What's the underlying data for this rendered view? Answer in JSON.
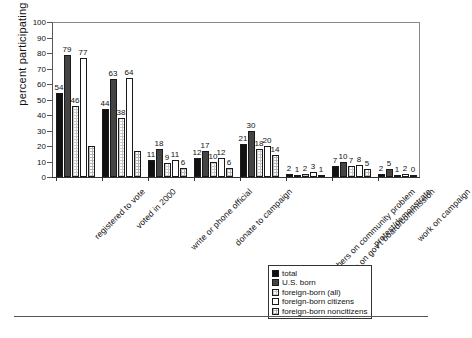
{
  "chart_data": {
    "type": "bar",
    "title": "",
    "xlabel": "",
    "ylabel": "percent participating",
    "ylim": [
      0,
      100
    ],
    "yticks": [
      0,
      10,
      20,
      30,
      40,
      50,
      60,
      70,
      80,
      90,
      100
    ],
    "grid": false,
    "legend_position": "bottom-right",
    "categories": [
      "registered to vote",
      "voted in 2000",
      "write or phone official",
      "donate to campaign",
      "work with others on community problem",
      "serve on gov't board/commission",
      "protest/demonstrate",
      "work on campaign"
    ],
    "series": [
      {
        "name": "total",
        "values": [
          54,
          44,
          11,
          12,
          21,
          2,
          7,
          2
        ]
      },
      {
        "name": "U.S. born",
        "values": [
          79,
          63,
          18,
          17,
          30,
          1,
          10,
          5
        ]
      },
      {
        "name": "foreign-born (all)",
        "values": [
          46,
          38,
          9,
          10,
          18,
          2,
          7,
          1
        ]
      },
      {
        "name": "foreign-born citizens",
        "values": [
          77,
          64,
          11,
          12,
          20,
          3,
          8,
          2
        ]
      },
      {
        "name": "foreign-born noncitizens",
        "values": [
          20,
          17,
          6,
          6,
          14,
          1,
          5,
          0
        ]
      }
    ],
    "value_labels": {
      "registered to vote": [
        "54",
        "79",
        "46",
        "77",
        ""
      ],
      "voted in 2000": [
        "44",
        "63",
        "38",
        "64",
        ""
      ],
      "write or phone official": [
        "11",
        "18",
        "9",
        "11",
        "6"
      ],
      "donate to campaign": [
        "12",
        "17",
        "10",
        "12",
        "6"
      ],
      "work with others on community problem": [
        "21",
        "30",
        "18",
        "20",
        "14"
      ],
      "serve on gov't board/commission": [
        "2",
        "1",
        "2",
        "3",
        "1"
      ],
      "protest/demonstrate": [
        "7",
        "10",
        "7",
        "8",
        "5"
      ],
      "work on campaign": [
        "2",
        "5",
        "1",
        "2",
        "0"
      ]
    },
    "series_colors": [
      "#111111",
      "#444444",
      "#ffffff",
      "#ffffff",
      "#ffffff"
    ]
  },
  "legend": {
    "items": [
      {
        "label": "total"
      },
      {
        "label": "U.S. born"
      },
      {
        "label": "foreign-born (all)"
      },
      {
        "label": "foreign-born citizens"
      },
      {
        "label": "foreign-born noncitizens"
      }
    ]
  }
}
